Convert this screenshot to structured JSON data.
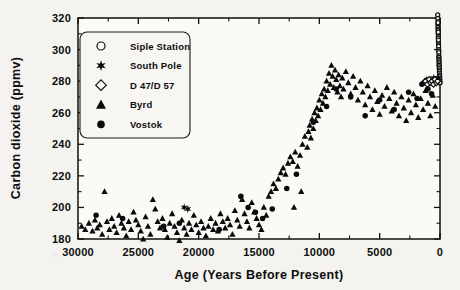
{
  "chart_data": {
    "type": "scatter",
    "title": "",
    "xlabel": "Age (Years Before Present)",
    "ylabel": "Carbon dioxide (ppmv)",
    "xlim": [
      30000,
      0
    ],
    "ylim": [
      180,
      320
    ],
    "x_ticks": [
      30000,
      25000,
      20000,
      15000,
      10000,
      5000,
      0
    ],
    "x_tick_labels": [
      "30000",
      "25000",
      "20000",
      "15000",
      "10000",
      "5000",
      "0"
    ],
    "x_minor_step": 2500,
    "y_ticks": [
      180,
      200,
      220,
      240,
      260,
      280,
      300,
      320
    ],
    "y_tick_labels": [
      "180",
      "200",
      "220",
      "240",
      "260",
      "280",
      "300",
      "320"
    ],
    "y_minor_step": 10,
    "x_axis_reversed": true,
    "grid": false,
    "legend_position": "upper-left",
    "series": [
      {
        "name": "Siple Station",
        "marker": "open-circle",
        "points": [
          [
            180,
            316
          ],
          [
            175,
            318
          ],
          [
            170,
            314
          ],
          [
            165,
            317
          ],
          [
            160,
            313
          ],
          [
            155,
            312
          ],
          [
            150,
            310
          ],
          [
            145,
            311
          ],
          [
            140,
            308
          ],
          [
            135,
            307
          ],
          [
            130,
            305
          ],
          [
            125,
            306
          ],
          [
            120,
            303
          ],
          [
            115,
            302
          ],
          [
            110,
            300
          ],
          [
            105,
            299
          ],
          [
            100,
            298
          ],
          [
            95,
            296
          ],
          [
            90,
            295
          ],
          [
            85,
            294
          ],
          [
            80,
            293
          ],
          [
            75,
            292
          ],
          [
            70,
            291
          ],
          [
            65,
            290
          ],
          [
            60,
            289
          ],
          [
            55,
            288
          ],
          [
            50,
            287
          ],
          [
            45,
            286
          ],
          [
            40,
            285
          ],
          [
            35,
            284
          ],
          [
            30,
            283
          ],
          [
            25,
            282
          ],
          [
            20,
            281
          ],
          [
            15,
            280
          ],
          [
            10,
            279
          ],
          [
            5,
            279
          ],
          [
            185,
            320
          ],
          [
            190,
            322
          ]
        ]
      },
      {
        "name": "South Pole",
        "marker": "star",
        "points": [
          [
            21200,
            200
          ],
          [
            20900,
            199
          ],
          [
            1100,
            281
          ],
          [
            950,
            280
          ],
          [
            870,
            279
          ],
          [
            760,
            281
          ],
          [
            640,
            280
          ],
          [
            520,
            282
          ],
          [
            430,
            279
          ],
          [
            330,
            281
          ],
          [
            240,
            280
          ],
          [
            160,
            282
          ]
        ]
      },
      {
        "name": "D 47/D 57",
        "marker": "open-diamond",
        "points": [
          [
            1350,
            279
          ],
          [
            1200,
            280
          ],
          [
            1050,
            278
          ],
          [
            900,
            281
          ],
          [
            780,
            279
          ],
          [
            660,
            280
          ],
          [
            540,
            278
          ],
          [
            420,
            281
          ],
          [
            300,
            279
          ],
          [
            200,
            280
          ]
        ]
      },
      {
        "name": "Byrd",
        "marker": "filled-triangle",
        "points": [
          [
            29700,
            188
          ],
          [
            29400,
            186
          ],
          [
            29100,
            190
          ],
          [
            28800,
            185
          ],
          [
            28600,
            192
          ],
          [
            28400,
            187
          ],
          [
            28200,
            189
          ],
          [
            28000,
            183
          ],
          [
            27800,
            210
          ],
          [
            27600,
            191
          ],
          [
            27400,
            186
          ],
          [
            27200,
            193
          ],
          [
            27000,
            188
          ],
          [
            26800,
            184
          ],
          [
            26600,
            195
          ],
          [
            26400,
            190
          ],
          [
            26200,
            187
          ],
          [
            26000,
            182
          ],
          [
            25800,
            191
          ],
          [
            25600,
            186
          ],
          [
            25400,
            197
          ],
          [
            25200,
            192
          ],
          [
            25000,
            189
          ],
          [
            24800,
            185
          ],
          [
            24600,
            180
          ],
          [
            24400,
            194
          ],
          [
            24200,
            188
          ],
          [
            24000,
            183
          ],
          [
            23800,
            205
          ],
          [
            23600,
            199
          ],
          [
            23400,
            191
          ],
          [
            23200,
            187
          ],
          [
            23000,
            193
          ],
          [
            22800,
            186
          ],
          [
            22600,
            181
          ],
          [
            22400,
            190
          ],
          [
            22200,
            196
          ],
          [
            22000,
            188
          ],
          [
            21800,
            184
          ],
          [
            21600,
            179
          ],
          [
            21400,
            192
          ],
          [
            21200,
            187
          ],
          [
            21000,
            183
          ],
          [
            20800,
            190
          ],
          [
            20600,
            186
          ],
          [
            20400,
            195
          ],
          [
            20200,
            189
          ],
          [
            20000,
            184
          ],
          [
            19800,
            191
          ],
          [
            19600,
            187
          ],
          [
            19400,
            182
          ],
          [
            19200,
            188
          ],
          [
            19000,
            193
          ],
          [
            18800,
            186
          ],
          [
            18600,
            190
          ],
          [
            18400,
            185
          ],
          [
            18200,
            196
          ],
          [
            18000,
            191
          ],
          [
            17800,
            187
          ],
          [
            17600,
            193
          ],
          [
            17400,
            189
          ],
          [
            17200,
            183
          ],
          [
            17000,
            198
          ],
          [
            16800,
            192
          ],
          [
            16600,
            188
          ],
          [
            16400,
            205
          ],
          [
            16200,
            196
          ],
          [
            16000,
            191
          ],
          [
            15800,
            187
          ],
          [
            15600,
            203
          ],
          [
            15400,
            197
          ],
          [
            15200,
            193
          ],
          [
            15000,
            189
          ],
          [
            14800,
            186
          ],
          [
            14600,
            200
          ],
          [
            14400,
            195
          ],
          [
            14200,
            207
          ],
          [
            14000,
            210
          ],
          [
            13800,
            215
          ],
          [
            13600,
            212
          ],
          [
            13400,
            218
          ],
          [
            13200,
            222
          ],
          [
            13000,
            225
          ],
          [
            12800,
            221
          ],
          [
            12600,
            228
          ],
          [
            12400,
            232
          ],
          [
            12200,
            229
          ],
          [
            12000,
            235
          ],
          [
            11800,
            226
          ],
          [
            11600,
            233
          ],
          [
            11400,
            240
          ],
          [
            11200,
            245
          ],
          [
            11000,
            238
          ],
          [
            10900,
            248
          ],
          [
            10800,
            252
          ],
          [
            10700,
            244
          ],
          [
            10600,
            256
          ],
          [
            10500,
            250
          ],
          [
            10400,
            260
          ],
          [
            10300,
            255
          ],
          [
            10200,
            263
          ],
          [
            10100,
            258
          ],
          [
            10000,
            268
          ],
          [
            9900,
            262
          ],
          [
            9800,
            272
          ],
          [
            9700,
            266
          ],
          [
            9600,
            275
          ],
          [
            9500,
            270
          ],
          [
            9400,
            280
          ],
          [
            9300,
            274
          ],
          [
            9200,
            285
          ],
          [
            9100,
            278
          ],
          [
            9000,
            290
          ],
          [
            8900,
            283
          ],
          [
            8800,
            276
          ],
          [
            8700,
            287
          ],
          [
            8600,
            281
          ],
          [
            8500,
            273
          ],
          [
            8400,
            284
          ],
          [
            8300,
            277
          ],
          [
            8200,
            270
          ],
          [
            8100,
            282
          ],
          [
            8000,
            275
          ],
          [
            7800,
            286
          ],
          [
            7600,
            279
          ],
          [
            7400,
            272
          ],
          [
            7200,
            283
          ],
          [
            7000,
            276
          ],
          [
            6800,
            268
          ],
          [
            6600,
            280
          ],
          [
            6400,
            273
          ],
          [
            6200,
            265
          ],
          [
            6000,
            277
          ],
          [
            5800,
            270
          ],
          [
            5600,
            262
          ],
          [
            5400,
            274
          ],
          [
            5200,
            267
          ],
          [
            5000,
            259
          ],
          [
            4800,
            271
          ],
          [
            4600,
            264
          ],
          [
            4400,
            276
          ],
          [
            4200,
            269
          ],
          [
            4000,
            261
          ],
          [
            3800,
            273
          ],
          [
            3600,
            266
          ],
          [
            3400,
            258
          ],
          [
            3200,
            270
          ],
          [
            3000,
            263
          ],
          [
            2800,
            255
          ],
          [
            2600,
            268
          ],
          [
            2400,
            260
          ],
          [
            2200,
            272
          ],
          [
            2000,
            265
          ],
          [
            1800,
            257
          ],
          [
            1600,
            269
          ],
          [
            1400,
            262
          ],
          [
            1200,
            274
          ],
          [
            1000,
            266
          ],
          [
            800,
            258
          ],
          [
            600,
            271
          ],
          [
            400,
            264
          ],
          [
            12100,
            200
          ],
          [
            11500,
            210
          ]
        ]
      },
      {
        "name": "Vostok",
        "marker": "filled-circle",
        "points": [
          [
            28500,
            195
          ],
          [
            26300,
            193
          ],
          [
            22900,
            188
          ],
          [
            21600,
            190
          ],
          [
            18300,
            186
          ],
          [
            16500,
            207
          ],
          [
            15900,
            200
          ],
          [
            15300,
            197
          ],
          [
            14700,
            193
          ],
          [
            13900,
            199
          ],
          [
            12700,
            212
          ],
          [
            11900,
            221
          ],
          [
            10500,
            254
          ],
          [
            9400,
            264
          ],
          [
            8600,
            275
          ],
          [
            7400,
            270
          ],
          [
            6200,
            258
          ],
          [
            5000,
            268
          ],
          [
            3800,
            262
          ],
          [
            2600,
            273
          ],
          [
            1900,
            269
          ],
          [
            1500,
            278
          ],
          [
            1000,
            275
          ],
          [
            700,
            272
          ]
        ]
      }
    ]
  },
  "legend": {
    "items": [
      {
        "label": "Siple Station",
        "marker": "open-circle"
      },
      {
        "label": "South Pole",
        "marker": "star"
      },
      {
        "label": "D 47/D 57",
        "marker": "open-diamond"
      },
      {
        "label": "Byrd",
        "marker": "filled-triangle"
      },
      {
        "label": "Vostok",
        "marker": "filled-circle"
      }
    ]
  }
}
